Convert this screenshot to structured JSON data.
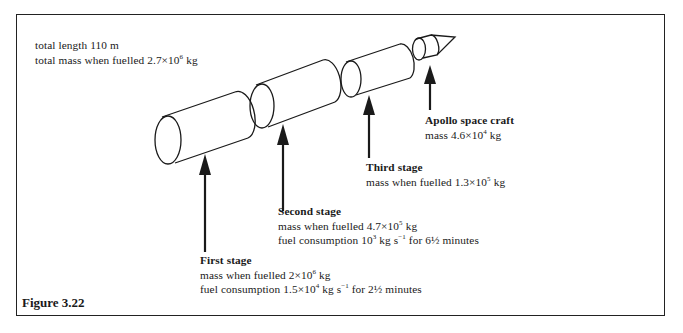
{
  "figure": {
    "label": "Figure 3.22"
  },
  "overall": {
    "length": "total length 110 m",
    "mass_prefix": "total mass when fuelled 2.7×10",
    "mass_exp": "6",
    "mass_unit": " kg"
  },
  "stages": [
    {
      "name": "First stage",
      "mass_prefix": "mass when fuelled 2×10",
      "mass_exp": "6",
      "mass_unit": " kg",
      "fuel_prefix": "fuel consumption 1.5×10",
      "fuel_exp": "4",
      "fuel_mid": " kg s",
      "fuel_rate_exp": "−1",
      "fuel_suffix": " for 2½ minutes"
    },
    {
      "name": "Second stage",
      "mass_prefix": "mass when fuelled 4.7×10",
      "mass_exp": "5",
      "mass_unit": " kg",
      "fuel_prefix": "fuel consumption 10",
      "fuel_exp": "3",
      "fuel_mid": " kg s",
      "fuel_rate_exp": "−1",
      "fuel_suffix": " for 6½ minutes"
    },
    {
      "name": "Third stage",
      "mass_prefix": "mass when fuelled 1.3×10",
      "mass_exp": "5",
      "mass_unit": " kg"
    },
    {
      "name": "Apollo space craft",
      "mass_prefix": "mass 4.6×10",
      "mass_exp": "4",
      "mass_unit": " kg"
    }
  ],
  "colors": {
    "ink": "#1a1a1a",
    "background": "#ffffff"
  }
}
